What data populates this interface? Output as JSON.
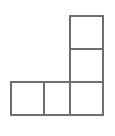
{
  "figure": {
    "name": "polyomino-figure",
    "background_color": "#ffffff",
    "line_color": "#6e6e6e",
    "cell_fill_color": "#ffffff",
    "line_width": 2,
    "canvas": {
      "width": 115,
      "height": 136
    },
    "grid": {
      "x_lines": [
        11,
        44,
        70,
        103
      ],
      "y_lines": [
        16,
        49,
        82,
        115
      ],
      "columns": 3,
      "rows": 3
    },
    "cell_count": 5,
    "cells": [
      {
        "name": "cell-top-right",
        "row": 0,
        "col": 2,
        "x": 70,
        "y": 16,
        "width": 33,
        "height": 33
      },
      {
        "name": "cell-middle-right",
        "row": 1,
        "col": 2,
        "x": 70,
        "y": 49,
        "width": 33,
        "height": 33
      },
      {
        "name": "cell-bottom-left",
        "row": 2,
        "col": 0,
        "x": 11,
        "y": 82,
        "width": 33,
        "height": 33
      },
      {
        "name": "cell-bottom-mid",
        "row": 2,
        "col": 1,
        "x": 44,
        "y": 82,
        "width": 26,
        "height": 33
      },
      {
        "name": "cell-bottom-right",
        "row": 2,
        "col": 2,
        "x": 70,
        "y": 82,
        "width": 33,
        "height": 33
      }
    ],
    "outline_path": "M 70 16 L 103 16 L 103 115 L 11 115 L 11 82 L 70 82 Z",
    "interior_segments": [
      {
        "name": "divider-horizontal-upper",
        "x1": 70,
        "y1": 49,
        "x2": 103,
        "y2": 49
      },
      {
        "name": "divider-horizontal-lower",
        "x1": 70,
        "y1": 82,
        "x2": 103,
        "y2": 82
      },
      {
        "name": "divider-vertical-left",
        "x1": 44,
        "y1": 82,
        "x2": 44,
        "y2": 115
      },
      {
        "name": "divider-vertical-right",
        "x1": 70,
        "y1": 82,
        "x2": 70,
        "y2": 115
      }
    ]
  }
}
